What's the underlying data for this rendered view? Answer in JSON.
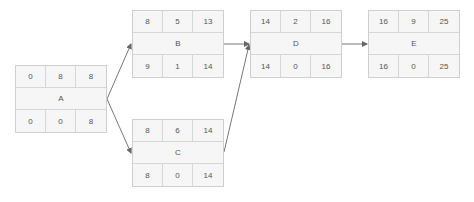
{
  "diagram": {
    "type": "activity-on-node network",
    "nodes": [
      {
        "id": "A",
        "name": "A",
        "top": [
          "0",
          "8",
          "8"
        ],
        "bottom": [
          "0",
          "0",
          "8"
        ],
        "x": 15,
        "y": 65
      },
      {
        "id": "B",
        "name": "B",
        "top": [
          "8",
          "5",
          "13"
        ],
        "bottom": [
          "9",
          "1",
          "14"
        ],
        "x": 132,
        "y": 10
      },
      {
        "id": "C",
        "name": "C",
        "top": [
          "8",
          "6",
          "14"
        ],
        "bottom": [
          "8",
          "0",
          "14"
        ],
        "x": 132,
        "y": 119
      },
      {
        "id": "D",
        "name": "D",
        "top": [
          "14",
          "2",
          "16"
        ],
        "bottom": [
          "14",
          "0",
          "16"
        ],
        "x": 250,
        "y": 10
      },
      {
        "id": "E",
        "name": "E",
        "top": [
          "16",
          "9",
          "25"
        ],
        "bottom": [
          "16",
          "0",
          "25"
        ],
        "x": 368,
        "y": 10
      }
    ],
    "edges": [
      {
        "from": "A",
        "to": "B"
      },
      {
        "from": "A",
        "to": "C"
      },
      {
        "from": "B",
        "to": "D"
      },
      {
        "from": "C",
        "to": "D"
      },
      {
        "from": "D",
        "to": "E"
      }
    ],
    "colors": {
      "node_fill": "#f6f6f6",
      "node_border": "#cfcfcf",
      "text": "#555555",
      "edge": "#666666"
    }
  }
}
